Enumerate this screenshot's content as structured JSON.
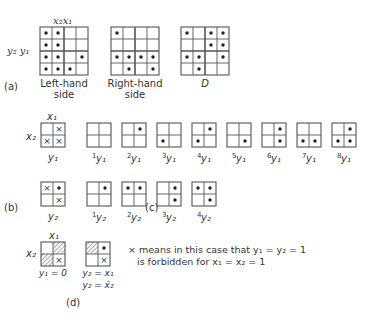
{
  "grid_color": "#555555",
  "dot_color": "#222222",
  "part_a": {
    "label": "(a)",
    "axis_top": "x₂x₁",
    "axis_left": "y₂ y₁",
    "grids": [
      {
        "name": "left-hand-side",
        "caption": [
          "Left-hand",
          "side"
        ],
        "x": 40,
        "y": 27,
        "cell": 12,
        "size": 4,
        "dots": [
          [
            0,
            0
          ],
          [
            0,
            1
          ],
          [
            1,
            0
          ],
          [
            1,
            1
          ],
          [
            2,
            0
          ],
          [
            2,
            1
          ],
          [
            2,
            3
          ],
          [
            3,
            0
          ],
          [
            3,
            1
          ],
          [
            3,
            2
          ]
        ]
      },
      {
        "name": "right-hand-side",
        "caption": [
          "Right-hand",
          "side"
        ],
        "x": 111,
        "y": 27,
        "cell": 12,
        "size": 4,
        "dots": [
          [
            0,
            0
          ],
          [
            2,
            0
          ],
          [
            2,
            1
          ],
          [
            2,
            2
          ],
          [
            2,
            3
          ],
          [
            3,
            1
          ],
          [
            3,
            3
          ]
        ]
      },
      {
        "name": "d-map",
        "caption": [
          "D"
        ],
        "x": 181,
        "y": 27,
        "cell": 12,
        "size": 4,
        "dots": [
          [
            0,
            0
          ],
          [
            0,
            2
          ],
          [
            0,
            3
          ],
          [
            1,
            2
          ],
          [
            1,
            3
          ],
          [
            2,
            0
          ],
          [
            2,
            1
          ],
          [
            2,
            3
          ],
          [
            3,
            1
          ]
        ]
      }
    ]
  },
  "part_b": {
    "label": "(b)",
    "grids": [
      {
        "name": "b-y1",
        "caption": "y₁",
        "top_label": "x₁",
        "left_label": "x₂",
        "x": 41,
        "y": 123,
        "cell": 12,
        "size": 2,
        "dots": [],
        "crosses": [
          [
            0,
            1
          ],
          [
            1,
            0
          ],
          [
            1,
            1
          ]
        ]
      },
      {
        "name": "b-y2",
        "caption": "y₂",
        "x": 41,
        "y": 182,
        "cell": 12,
        "size": 2,
        "dots": [
          [
            0,
            1
          ]
        ],
        "crosses": [
          [
            0,
            0
          ],
          [
            1,
            1
          ]
        ]
      }
    ]
  },
  "part_c": {
    "label": "(c)",
    "row_y1": [
      {
        "caption_sup": "1",
        "caption": "y₁",
        "x": 87,
        "dots": []
      },
      {
        "caption_sup": "2",
        "caption": "y₁",
        "x": 122,
        "dots": [
          [
            0,
            1
          ]
        ]
      },
      {
        "caption_sup": "3",
        "caption": "y₁",
        "x": 157,
        "dots": [
          [
            1,
            0
          ]
        ]
      },
      {
        "caption_sup": "4",
        "caption": "y₁",
        "x": 192,
        "dots": [
          [
            0,
            1
          ],
          [
            1,
            0
          ]
        ]
      },
      {
        "caption_sup": "5",
        "caption": "y₁",
        "x": 227,
        "dots": [
          [
            1,
            1
          ]
        ]
      },
      {
        "caption_sup": "6",
        "caption": "y₁",
        "x": 262,
        "dots": [
          [
            0,
            1
          ],
          [
            1,
            1
          ]
        ]
      },
      {
        "caption_sup": "7",
        "caption": "y₁",
        "x": 297,
        "dots": [
          [
            1,
            0
          ],
          [
            1,
            1
          ]
        ]
      },
      {
        "caption_sup": "8",
        "caption": "y₁",
        "x": 332,
        "dots": [
          [
            0,
            1
          ],
          [
            1,
            0
          ],
          [
            1,
            1
          ]
        ]
      }
    ],
    "row_y2": [
      {
        "caption_sup": "1",
        "caption": "y₂",
        "x": 87,
        "dots": [
          [
            0,
            1
          ]
        ]
      },
      {
        "caption_sup": "2",
        "caption": "y₂",
        "x": 122,
        "dots": [
          [
            0,
            0
          ],
          [
            0,
            1
          ]
        ]
      },
      {
        "caption_sup": "3",
        "caption": "y₂",
        "x": 157,
        "dots": [
          [
            0,
            1
          ],
          [
            1,
            1
          ]
        ]
      },
      {
        "caption_sup": "4",
        "caption": "y₂",
        "x": 192,
        "dots": [
          [
            0,
            0
          ],
          [
            0,
            1
          ],
          [
            1,
            1
          ]
        ]
      }
    ]
  },
  "part_d": {
    "label": "(d)",
    "grids": [
      {
        "name": "d-y1",
        "top_label": "x₁",
        "left_label": "x₂",
        "captions": [
          "y₁ = 0"
        ],
        "x": 41,
        "y": 242,
        "cell": 12,
        "size": 2,
        "hatched": [
          [
            0,
            1
          ],
          [
            1,
            0
          ]
        ],
        "dots": [],
        "crosses": [
          [
            1,
            1
          ]
        ]
      },
      {
        "name": "d-y2",
        "captions": [
          "y₂ = x₁",
          "y₂ = x̄₂"
        ],
        "x": 86,
        "y": 242,
        "cell": 12,
        "size": 2,
        "hatched": [
          [
            0,
            0
          ]
        ],
        "dots": [
          [
            0,
            1
          ]
        ],
        "crosses": [
          [
            1,
            1
          ]
        ]
      }
    ],
    "note_line1": "× means in this case that  y₁ = y₂ = 1",
    "note_line2": "is forbidden for  x₁ = x₂ = 1"
  }
}
